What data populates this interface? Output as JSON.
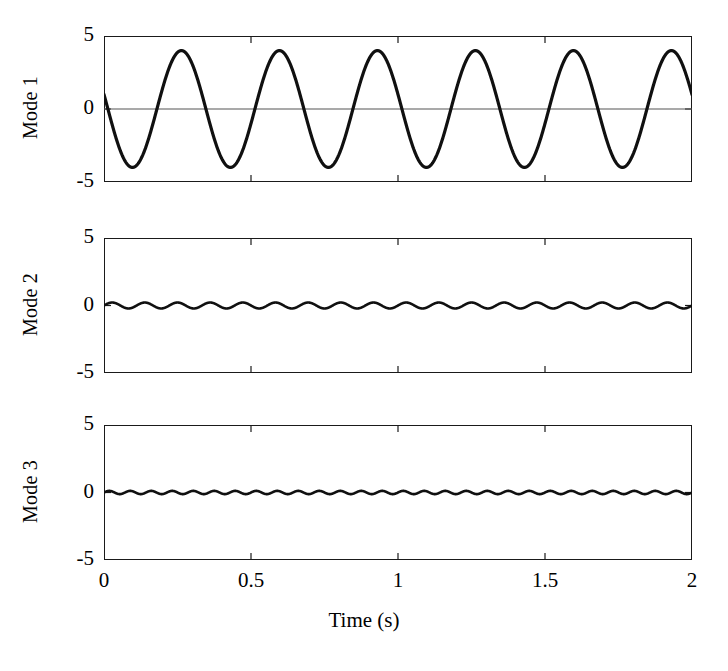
{
  "figure": {
    "width": 728,
    "height": 671,
    "background": "#ffffff",
    "line_color": "#101010",
    "axis_color": "#1a1a1a",
    "zero_line_color": "#555555"
  },
  "axis": {
    "xlabel": "Time (s)",
    "xlim": [
      0,
      2
    ],
    "xticks": [
      0,
      0.5,
      1,
      1.5,
      2
    ],
    "xticklabels": [
      "0",
      "0.5",
      "1",
      "1.5",
      "2"
    ],
    "ylim": [
      -5,
      5
    ],
    "yticks": [
      -5,
      0,
      5
    ],
    "yticklabels": [
      "-5",
      "0",
      "5"
    ],
    "grid": false,
    "tick_direction": "in",
    "frame": "box"
  },
  "chart_data": {
    "type": "line",
    "title": "",
    "xlabel": "Time (s)",
    "ylabel": "",
    "xlim": [
      0,
      2
    ],
    "ylim": [
      -5,
      5
    ],
    "xticks": [
      0,
      0.5,
      1,
      1.5,
      2
    ],
    "yticks": [
      -5,
      0,
      5
    ],
    "grid": false,
    "legend": "none",
    "shared_x_axis": true,
    "panels": [
      {
        "label": "Mode 1",
        "ylabel": "Mode 1",
        "ylim": [
          -5,
          5
        ],
        "yticks": [
          -5,
          0,
          5
        ],
        "zero_reference_line": true,
        "waveform": "sinusoid",
        "amplitude": 4.0,
        "frequency_hz": 3.0,
        "phase_rad": 2.89,
        "offset": 0.0,
        "n_cycles_over_window": 6,
        "value_at_t0": 1.0,
        "peak_max": 4.0,
        "peak_min": -4.0,
        "first_trough_time_s": 0.12,
        "first_peak_time_s": 0.29
      },
      {
        "label": "Mode 2",
        "ylabel": "Mode 2",
        "ylim": [
          -5,
          5
        ],
        "yticks": [
          -5,
          0,
          5
        ],
        "zero_reference_line": false,
        "waveform": "sinusoid",
        "amplitude": 0.22,
        "frequency_hz": 9.0,
        "phase_rad": 0.0,
        "offset": 0.0,
        "n_cycles_over_window": 18,
        "value_at_t0": 0.0,
        "peak_max": 0.22,
        "peak_min": -0.22
      },
      {
        "label": "Mode 3",
        "ylabel": "Mode 3",
        "ylim": [
          -5,
          5
        ],
        "yticks": [
          -5,
          0,
          5
        ],
        "zero_reference_line": false,
        "waveform": "sinusoid",
        "amplitude": 0.12,
        "frequency_hz": 14.0,
        "phase_rad": 0.0,
        "offset": 0.0,
        "n_cycles_over_window": 28,
        "value_at_t0": 0.0,
        "peak_max": 0.12,
        "peak_min": -0.12
      }
    ]
  },
  "geometry": {
    "plot_left": 104,
    "plot_right": 692,
    "panels": [
      {
        "top": 36,
        "bottom": 182
      },
      {
        "top": 238,
        "bottom": 373
      },
      {
        "top": 425,
        "bottom": 560
      }
    ]
  }
}
